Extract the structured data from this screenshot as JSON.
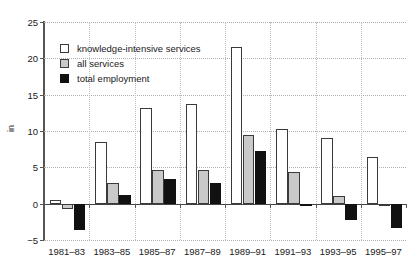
{
  "chart_data": {
    "type": "bar",
    "title": "",
    "xlabel": "",
    "ylabel": "in",
    "ylim": [
      -5,
      25
    ],
    "yticks": [
      -5,
      0,
      5,
      10,
      15,
      20,
      25
    ],
    "grid": true,
    "legend_position": "upper-left-inside",
    "categories": [
      "1981–83",
      "1983–85",
      "1985–87",
      "1987–89",
      "1989–91",
      "1991–93",
      "1993–95",
      "1995–97"
    ],
    "series": [
      {
        "name": "knowledge-intensive services",
        "color": "#ffffff",
        "values": [
          0.5,
          8.5,
          13.1,
          13.7,
          21.6,
          10.3,
          9.0,
          6.4
        ]
      },
      {
        "name": "all services",
        "color": "#c9c9c9",
        "values": [
          -0.7,
          2.9,
          4.7,
          4.6,
          9.4,
          4.4,
          1.0,
          -0.3
        ]
      },
      {
        "name": "total employment",
        "color": "#111111",
        "values": [
          -3.6,
          1.2,
          3.4,
          2.8,
          7.2,
          -0.3,
          -2.2,
          -3.3
        ]
      }
    ]
  },
  "legend": {
    "items": [
      {
        "label": "knowledge-intensive services",
        "key": "kis"
      },
      {
        "label": "all services",
        "key": "all"
      },
      {
        "label": "total employment",
        "key": "total"
      }
    ]
  },
  "axis": {
    "y_label": "in"
  }
}
